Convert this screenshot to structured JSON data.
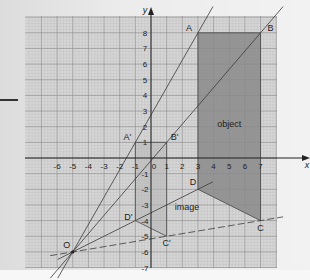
{
  "figure": {
    "axes": {
      "x_label": "x",
      "y_label": "y",
      "x_ticks": [
        "-6",
        "-5",
        "-4",
        "-3",
        "-2",
        "-1",
        "0",
        "1",
        "2",
        "3",
        "4",
        "5",
        "6",
        "7"
      ],
      "y_ticks_pos": [
        "1",
        "2",
        "3",
        "4",
        "5",
        "6",
        "7",
        "8"
      ],
      "y_ticks_neg": [
        "-1",
        "-2",
        "-3",
        "-4",
        "-5",
        "-6",
        "-7"
      ],
      "xlim": [
        -7.8,
        8.2
      ],
      "ylim": [
        -7.0,
        9.0
      ]
    },
    "center": {
      "label": "O",
      "x": -5,
      "y": -6
    },
    "object": {
      "label": "object",
      "vertices": [
        {
          "label": "A",
          "x": 3,
          "y": 8
        },
        {
          "label": "B",
          "x": 7,
          "y": 8
        },
        {
          "label": "C",
          "x": 7,
          "y": -4
        },
        {
          "label": "D",
          "x": 3,
          "y": -2
        }
      ],
      "fill": "#8a8a8a"
    },
    "image": {
      "label": "image",
      "vertices": [
        {
          "label": "A'",
          "x": -1,
          "y": 1
        },
        {
          "label": "B'",
          "x": 1,
          "y": 1
        },
        {
          "label": "C'",
          "x": 1,
          "y": -5
        },
        {
          "label": "D'",
          "x": -1,
          "y": -4
        }
      ],
      "fill": "#b4b4b4"
    },
    "colors": {
      "paper": "#d6d6d6",
      "grid_minor": "#b9b9b9",
      "grid_major": "#8f8f8f",
      "axis": "#222222",
      "ray": "#3a3a3a"
    }
  }
}
